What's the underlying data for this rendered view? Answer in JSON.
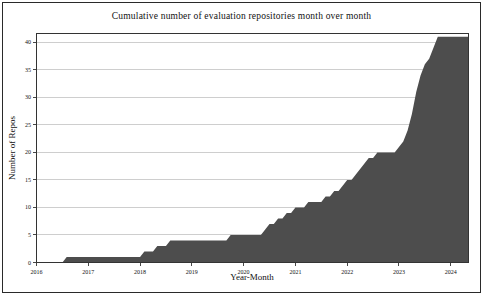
{
  "chart_data": {
    "type": "area",
    "title": "Cumulative number of evaluation repositories month over month",
    "xlabel": "Year-Month",
    "ylabel": "Number of Repos",
    "x_start_month": "2016-01",
    "x_end_month": "2024-05",
    "x_tick_labels": [
      "2016",
      "2017",
      "2018",
      "2019",
      "2020",
      "2021",
      "2022",
      "2023",
      "2024"
    ],
    "y_ticks": [
      0,
      5,
      10,
      15,
      20,
      25,
      30,
      35,
      40
    ],
    "ylim": [
      0,
      41.7
    ],
    "grid": true,
    "legend": "none",
    "fill_color": "#4d4d4d",
    "grid_color": "#c9c9c9",
    "spine_color": "#333333",
    "final_value": 41,
    "cumulative_steps": [
      [
        "2016-01",
        0
      ],
      [
        "2016-08",
        1
      ],
      [
        "2018-02",
        2
      ],
      [
        "2018-05",
        3
      ],
      [
        "2018-08",
        4
      ],
      [
        "2019-10",
        5
      ],
      [
        "2020-06",
        6
      ],
      [
        "2020-07",
        7
      ],
      [
        "2020-09",
        8
      ],
      [
        "2020-11",
        9
      ],
      [
        "2021-01",
        10
      ],
      [
        "2021-04",
        11
      ],
      [
        "2021-08",
        12
      ],
      [
        "2021-10",
        13
      ],
      [
        "2021-12",
        14
      ],
      [
        "2022-01",
        15
      ],
      [
        "2022-03",
        16
      ],
      [
        "2022-04",
        17
      ],
      [
        "2022-05",
        18
      ],
      [
        "2022-06",
        19
      ],
      [
        "2022-08",
        20
      ],
      [
        "2023-01",
        21
      ],
      [
        "2023-02",
        22
      ],
      [
        "2023-03",
        24
      ],
      [
        "2023-04",
        27
      ],
      [
        "2023-05",
        31
      ],
      [
        "2023-06",
        34
      ],
      [
        "2023-07",
        36
      ],
      [
        "2023-08",
        37
      ],
      [
        "2023-09",
        39
      ],
      [
        "2023-10",
        41
      ]
    ]
  }
}
